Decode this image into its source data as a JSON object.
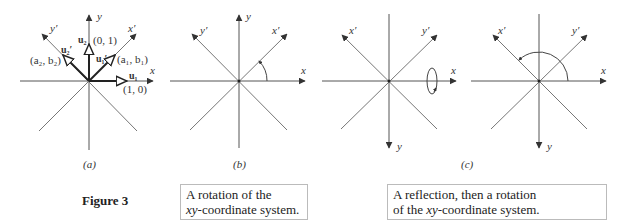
{
  "figure": {
    "title": "Figure 3",
    "panels": [
      {
        "id": "a",
        "label": "(a)",
        "axes": {
          "x": "x",
          "y": "y",
          "xprime": "x′",
          "yprime": "y′"
        },
        "vectors": {
          "u1": "u₁",
          "u1_coord": "(1, 0)",
          "u2": "u₂",
          "u2_coord": "(0, 1)",
          "u1p": "u₁′",
          "u1p_coord": "(a₁, b₁)",
          "u2p": "u₂′",
          "u2p_coord": "(a₂, b₂)"
        }
      },
      {
        "id": "b",
        "label": "(b)",
        "axes": {
          "x": "x",
          "y": "y",
          "xprime": "x′",
          "yprime": "y′"
        }
      },
      {
        "id": "c1",
        "axes": {
          "x": "x",
          "y": "y",
          "xprime": "x′",
          "yprime": "y′"
        }
      },
      {
        "id": "c2",
        "axes": {
          "x": "x",
          "y": "y",
          "xprime": "x′",
          "yprime": "y′"
        }
      }
    ],
    "c_label": "(c)",
    "captions": {
      "b_line1": "A rotation of the",
      "b_line2_italic": "xy",
      "b_line2_rest": "-coordinate system.",
      "c_line1": "A reflection, then a rotation",
      "c_line2_pre": "of the ",
      "c_line2_italic": "xy",
      "c_line2_rest": "-coordinate system."
    },
    "colors": {
      "axis": "#888888",
      "arrow": "#333333",
      "vector": "#222222"
    }
  }
}
